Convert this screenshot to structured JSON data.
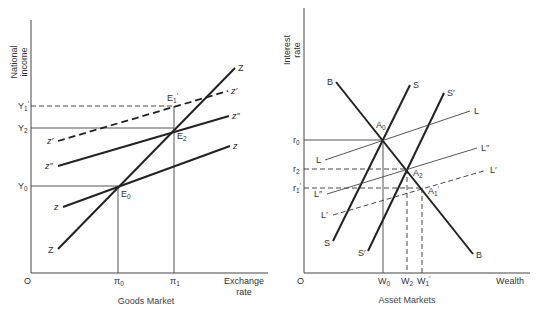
{
  "goods_market": {
    "caption": "Goods Market",
    "y_axis_label_line1": "National",
    "y_axis_label_line2": "income",
    "x_axis_label_line1": "Exchange",
    "x_axis_label_line2": "rate",
    "origin": "O",
    "y_ticks": {
      "Y1_prime": "Y",
      "Y2": "Y",
      "Y0": "Y"
    },
    "x_ticks": {
      "pi0": "π",
      "pi1": "π"
    },
    "curves": {
      "Z_top": "Z",
      "Z_bottom": "Z",
      "z_prime_right": "z′",
      "z_prime_left": "z′",
      "z_dprime_right": "z″",
      "z_dprime_left": "z″",
      "z_right": "z",
      "z_left": "z"
    },
    "points": {
      "E1_prime": "E",
      "E2": "E",
      "E0": "E"
    }
  },
  "asset_markets": {
    "caption": "Asset Markets",
    "y_axis_label_line1": "Interest",
    "y_axis_label_line2": "rate",
    "x_axis_label": "Wealth",
    "origin": "O",
    "y_ticks": {
      "r0": "r",
      "r2": "r",
      "r1_prime": "r"
    },
    "x_ticks": {
      "W0": "W",
      "W2": "W",
      "W1_prime": "W"
    },
    "curves": {
      "B_top": "B",
      "B_bottom": "B",
      "S_top": "S",
      "S_bottom": "S",
      "S_prime_top": "S′",
      "S_prime_bottom": "S′",
      "L_right": "L",
      "L_left": "L",
      "L_dprime_right": "L″",
      "L_dprime_left": "L″",
      "L_prime_right": "L′",
      "L_prime_left": "L′"
    },
    "points": {
      "A0": "A",
      "A2": "A",
      "A1_prime": "A"
    }
  },
  "subscripts": {
    "zero": "0",
    "one": "1",
    "two": "2",
    "prime": "′"
  }
}
